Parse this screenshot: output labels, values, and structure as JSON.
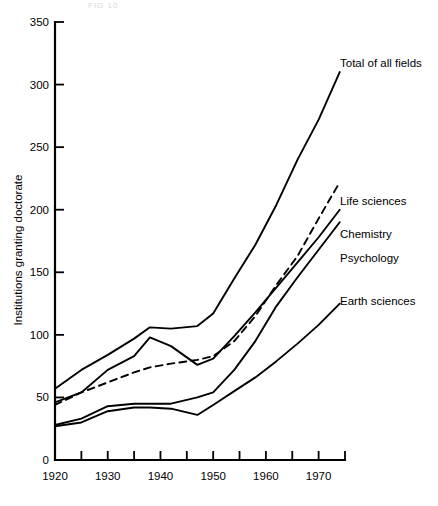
{
  "figure": {
    "background_color": "#ffffff",
    "ink_color": "#000000",
    "faint_header_text": "FIG 10"
  },
  "axes": {
    "y_axis_title": "Institutions granting doctorate",
    "y_ticks": [
      0,
      50,
      100,
      150,
      200,
      250,
      300,
      350
    ],
    "y_min": 0,
    "y_max": 350,
    "x_ticks_major": [
      1920,
      1930,
      1940,
      1950,
      1960,
      1970
    ],
    "x_ticks_minor": [
      1925,
      1935,
      1945,
      1955,
      1965,
      1975
    ],
    "x_min": 1920,
    "x_max": 1975
  },
  "labels": {
    "total": "Total of all fields",
    "life": "Life sciences",
    "chemistry": "Chemistry",
    "psychology": "Psychology",
    "earth": "Earth sciences"
  },
  "chart_data": {
    "type": "line",
    "title": "",
    "xlabel": "",
    "ylabel": "Institutions granting doctorate",
    "xlim": [
      1920,
      1975
    ],
    "ylim": [
      0,
      350
    ],
    "grid": false,
    "legend_position": "inline-right-annotations",
    "x": [
      1920,
      1925,
      1930,
      1935,
      1938,
      1942,
      1947,
      1950,
      1954,
      1958,
      1962,
      1966,
      1970,
      1974
    ],
    "series": [
      {
        "name": "Total of all fields",
        "style": "solid",
        "values": [
          57,
          72,
          84,
          97,
          106,
          105,
          107,
          117,
          145,
          172,
          204,
          240,
          272,
          310
        ]
      },
      {
        "name": "Life sciences",
        "style": "dashed",
        "values": [
          44,
          54,
          62,
          70,
          74,
          77,
          80,
          83,
          95,
          115,
          140,
          163,
          193,
          222
        ]
      },
      {
        "name": "Chemistry",
        "style": "solid",
        "values": [
          46,
          54,
          72,
          83,
          98,
          91,
          76,
          81,
          99,
          118,
          138,
          158,
          178,
          200
        ]
      },
      {
        "name": "Psychology",
        "style": "solid",
        "values": [
          28,
          33,
          43,
          45,
          45,
          45,
          50,
          54,
          72,
          95,
          123,
          146,
          168,
          190
        ]
      },
      {
        "name": "Earth sciences",
        "style": "solid",
        "values": [
          27,
          30,
          39,
          42,
          42,
          41,
          36,
          44,
          55,
          66,
          79,
          93,
          108,
          125
        ]
      }
    ]
  },
  "annotations": [
    {
      "text": "Total of all fields",
      "x": 340,
      "y": 67
    },
    {
      "text": "Life sciences",
      "x": 340,
      "y": 205
    },
    {
      "text": "Chemistry",
      "x": 340,
      "y": 238
    },
    {
      "text": "Psychology",
      "x": 340,
      "y": 262
    },
    {
      "text": "Earth sciences",
      "x": 340,
      "y": 305
    }
  ]
}
